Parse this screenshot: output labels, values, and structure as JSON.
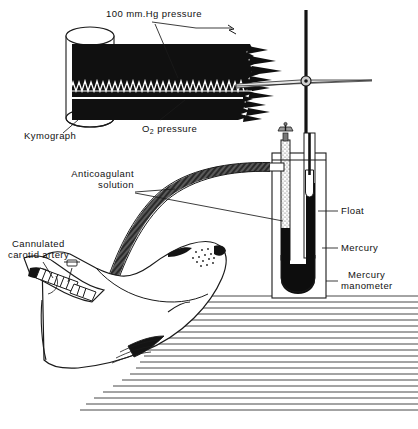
{
  "figure": {
    "background_color": "#ffffff",
    "ink_color": "#111111"
  },
  "labels": {
    "pressure_scale": "100 mm.Hg pressure",
    "kymograph": "Kymograph",
    "o2_pressure_prefix": "O",
    "o2_pressure_sub": "2",
    "o2_pressure_suffix": " pressure",
    "anticoagulant_line1": "Anticoagulant",
    "anticoagulant_line2": "solution",
    "cannulated_line1": "Cannulated",
    "cannulated_line2": "carotid artery",
    "float": "Float",
    "mercury": "Mercury",
    "mercury_manometer_line1": "Mercury",
    "mercury_manometer_line2": "manometer"
  },
  "components": {
    "kymograph_drum": "rotating smoked-paper drum",
    "trace_upper": "arterial pulse trace",
    "trace_lower": "oxygen pressure trace",
    "stylus_lever": "writing lever",
    "vertical_rod": "float rod",
    "manometer": "mercury U-tube manometer",
    "float": "manometer float",
    "stopcock": "stopcock valve",
    "tubing": "arterial cannula tubing",
    "animal": "seal",
    "floor": "hatched floor shading"
  },
  "colors": {
    "ink": "#111111",
    "paper": "#ffffff",
    "smoked_paper": "#101010",
    "mercury": "#0d0d0d",
    "tubing": "#4a4a4a",
    "stipple": "#8a8a8a"
  }
}
